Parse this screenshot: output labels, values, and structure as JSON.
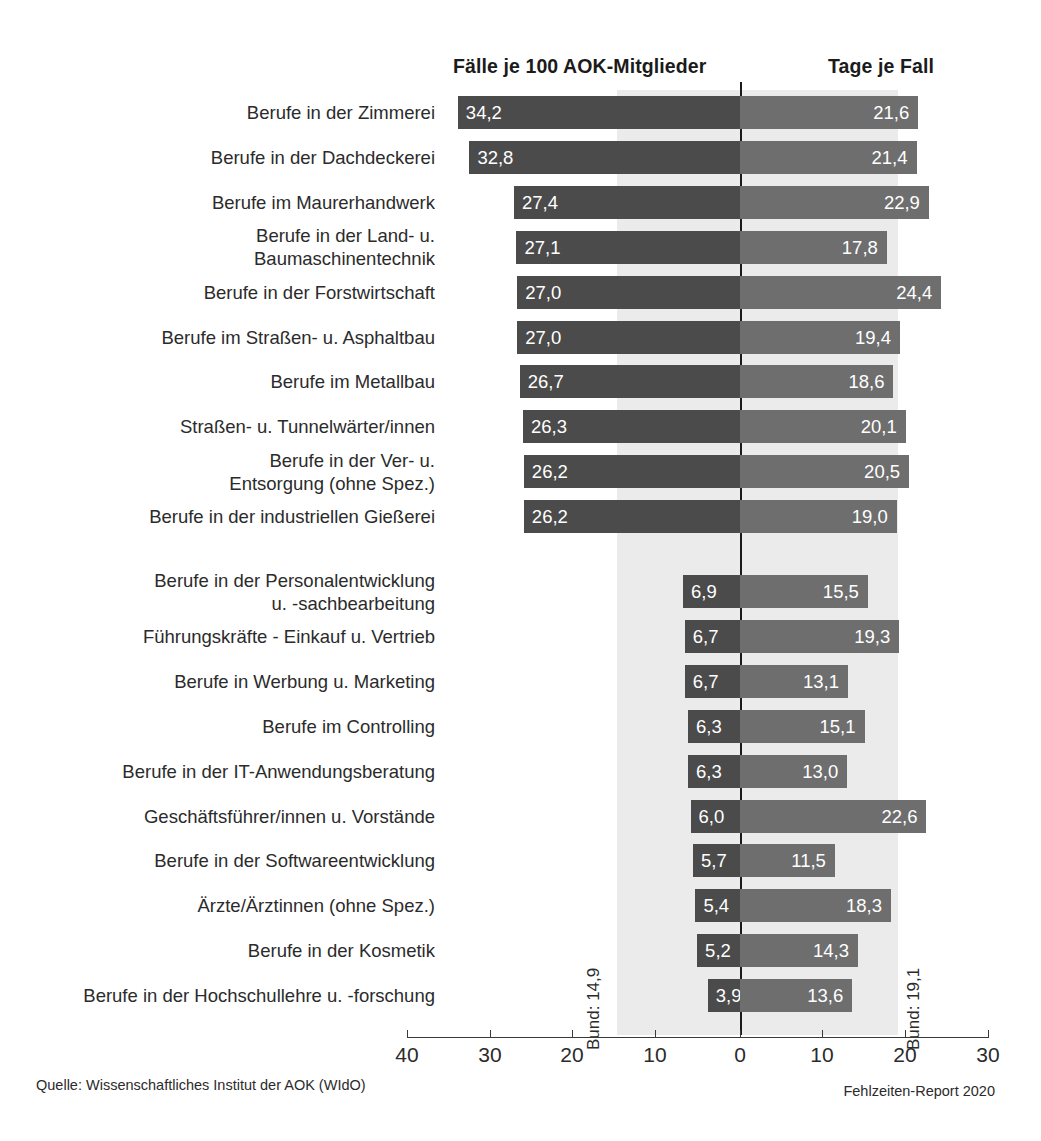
{
  "header": {
    "left_title": "Fälle je 100 AOK-Mitglieder",
    "right_title": "Tage je Fall"
  },
  "footer": {
    "source": "Quelle: Wissenschaftliches Institut der AOK (WIdO)",
    "report": "Fehlzeiten-Report 2020"
  },
  "reference": {
    "left_label": "Bund: 14,9",
    "right_label": "Bund: 19,1",
    "left_value": 14.9,
    "right_value": 19.1
  },
  "axis": {
    "ticks": [
      {
        "label": "40",
        "x": 407
      },
      {
        "label": "30",
        "x": 490
      },
      {
        "label": "20",
        "x": 572
      },
      {
        "label": "10",
        "x": 655
      },
      {
        "label": "0",
        "x": 740
      },
      {
        "label": "10",
        "x": 822
      },
      {
        "label": "20",
        "x": 905
      },
      {
        "label": "30",
        "x": 988
      }
    ]
  },
  "colors": {
    "bar_left": "#4b4b4b",
    "bar_right": "#6e6e6e",
    "band": "#ebebeb",
    "zero_line": "#1a1a1a",
    "text": "#2b2b2b"
  },
  "chart_data": {
    "type": "bar",
    "orientation": "horizontal",
    "layout": "diverging-paired",
    "title": "",
    "subtitle": "",
    "xlabel": "",
    "ylabel": "",
    "grid": false,
    "legend": "none",
    "left_axis": {
      "name": "Fälle je 100 AOK-Mitglieder",
      "direction": "left",
      "ticks": [
        40,
        30,
        20,
        10,
        0
      ],
      "range": [
        40,
        0
      ],
      "reference_line": 14.9,
      "reference_label": "Bund: 14,9"
    },
    "right_axis": {
      "name": "Tage je Fall",
      "direction": "right",
      "ticks": [
        0,
        10,
        20,
        30
      ],
      "range": [
        0,
        30
      ],
      "reference_line": 19.1,
      "reference_label": "Bund: 19,1"
    },
    "group_gap_after_index": 9,
    "categories": [
      "Berufe in der Zimmerei",
      "Berufe in der Dachdeckerei",
      "Berufe im Maurerhandwerk",
      "Berufe in der Land- u.\nBaumaschinentechnik",
      "Berufe in der Forstwirtschaft",
      "Berufe im Straßen- u. Asphaltbau",
      "Berufe im Metallbau",
      "Straßen- u. Tunnelwärter/innen",
      "Berufe in der Ver- u.\nEntsorgung (ohne Spez.)",
      "Berufe in der industriellen Gießerei",
      "Berufe in der Personalentwicklung\nu. -sachbearbeitung",
      "Führungskräfte - Einkauf u. Vertrieb",
      "Berufe in Werbung u. Marketing",
      "Berufe im Controlling",
      "Berufe in der IT-Anwendungsberatung",
      "Geschäftsführer/innen u. Vorstände",
      "Berufe in der Softwareentwicklung",
      "Ärzte/Ärztinnen (ohne Spez.)",
      "Berufe in der Kosmetik",
      "Berufe in der Hochschullehre u. -forschung"
    ],
    "series": [
      {
        "name": "Fälle je 100 AOK-Mitglieder",
        "side": "left",
        "values": [
          34.2,
          32.8,
          27.4,
          27.1,
          27.0,
          27.0,
          26.7,
          26.3,
          26.2,
          26.2,
          6.9,
          6.7,
          6.7,
          6.3,
          6.3,
          6.0,
          5.7,
          5.4,
          5.2,
          3.9
        ],
        "labels": [
          "34,2",
          "32,8",
          "27,4",
          "27,1",
          "27,0",
          "27,0",
          "26,7",
          "26,3",
          "26,2",
          "26,2",
          "6,9",
          "6,7",
          "6,7",
          "6,3",
          "6,3",
          "6,0",
          "5,7",
          "5,4",
          "5,2",
          "3,9"
        ]
      },
      {
        "name": "Tage je Fall",
        "side": "right",
        "values": [
          21.6,
          21.4,
          22.9,
          17.8,
          24.4,
          19.4,
          18.6,
          20.1,
          20.5,
          19.0,
          15.5,
          19.3,
          13.1,
          15.1,
          13.0,
          22.6,
          11.5,
          18.3,
          14.3,
          13.6
        ],
        "labels": [
          "21,6",
          "21,4",
          "22,9",
          "17,8",
          "24,4",
          "19,4",
          "18,6",
          "20,1",
          "20,5",
          "19,0",
          "15,5",
          "19,3",
          "13,1",
          "15,1",
          "13,0",
          "22,6",
          "11,5",
          "18,3",
          "14,3",
          "13,6"
        ]
      }
    ]
  }
}
